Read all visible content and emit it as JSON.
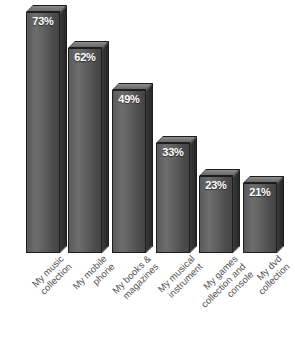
{
  "chart_data": {
    "type": "bar",
    "title": "",
    "xlabel": "",
    "ylabel": "",
    "ylim": [
      0,
      78
    ],
    "grid": false,
    "legend": "none",
    "value_suffix": "%",
    "style": "3d-grayscale",
    "categories": [
      "My music collection",
      "My mobile phone",
      "My books & magazines",
      "My musical instrument",
      "My games collection and console",
      "My dvd collection"
    ],
    "values": [
      73,
      62,
      49,
      33,
      23,
      21
    ],
    "data_labels": [
      "73%",
      "62%",
      "49%",
      "33%",
      "23%",
      "21%"
    ]
  },
  "bars": [
    {
      "label": "73%",
      "value": 73,
      "left": 26,
      "width": 34,
      "height": 241,
      "category_lines": [
        "My music",
        "collection"
      ],
      "label_left": 58,
      "label_width": 100
    },
    {
      "label": "62%",
      "value": 62,
      "left": 68,
      "width": 34,
      "height": 205,
      "category_lines": [
        "My mobile",
        "phone"
      ],
      "label_left": 101,
      "label_width": 100
    },
    {
      "label": "49%",
      "value": 49,
      "left": 112,
      "width": 34,
      "height": 163,
      "category_lines": [
        "My books &",
        "magazines"
      ],
      "label_left": 145,
      "label_width": 100
    },
    {
      "label": "33%",
      "value": 33,
      "left": 156,
      "width": 34,
      "height": 110,
      "category_lines": [
        "My musical",
        "instrument"
      ],
      "label_left": 189,
      "label_width": 100
    },
    {
      "label": "23%",
      "value": 23,
      "left": 199,
      "width": 34,
      "height": 77,
      "category_lines": [
        "My games",
        "collection and",
        "console"
      ],
      "label_left": 232,
      "label_width": 100
    },
    {
      "label": "21%",
      "value": 21,
      "left": 243,
      "width": 34,
      "height": 70,
      "category_lines": [
        "My dvd",
        "collection"
      ],
      "label_left": 276,
      "label_width": 100
    }
  ],
  "colors": {
    "bar_front": "#5e5e5e",
    "bar_side": "#2e2e2e",
    "bar_top": "#7b7b7b",
    "outline": "#1d1d1d",
    "value_text": "#ffffff",
    "category_text": "#555555",
    "background": "#ffffff"
  }
}
